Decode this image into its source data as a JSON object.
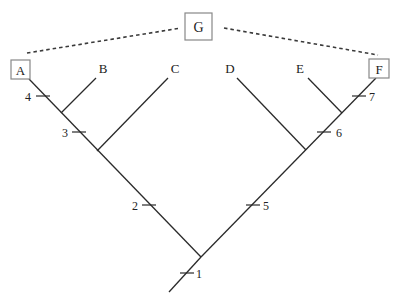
{
  "diagram": {
    "type": "cladogram",
    "outgroup_box": {
      "label": "G"
    },
    "taxa": [
      {
        "id": "A",
        "label": "A",
        "boxed": true
      },
      {
        "id": "B",
        "label": "B",
        "boxed": false
      },
      {
        "id": "C",
        "label": "C",
        "boxed": false
      },
      {
        "id": "D",
        "label": "D",
        "boxed": false
      },
      {
        "id": "E",
        "label": "E",
        "boxed": false
      },
      {
        "id": "F",
        "label": "F",
        "boxed": true
      }
    ],
    "character_ticks": [
      {
        "label": "1"
      },
      {
        "label": "2"
      },
      {
        "label": "3"
      },
      {
        "label": "4"
      },
      {
        "label": "5"
      },
      {
        "label": "6"
      },
      {
        "label": "7"
      }
    ],
    "dashed_links": [
      {
        "from": "G",
        "to": "A"
      },
      {
        "from": "G",
        "to": "F"
      }
    ],
    "colors": {
      "line": "#2a2a2a",
      "box_border": "#888888",
      "background": "#ffffff"
    }
  }
}
